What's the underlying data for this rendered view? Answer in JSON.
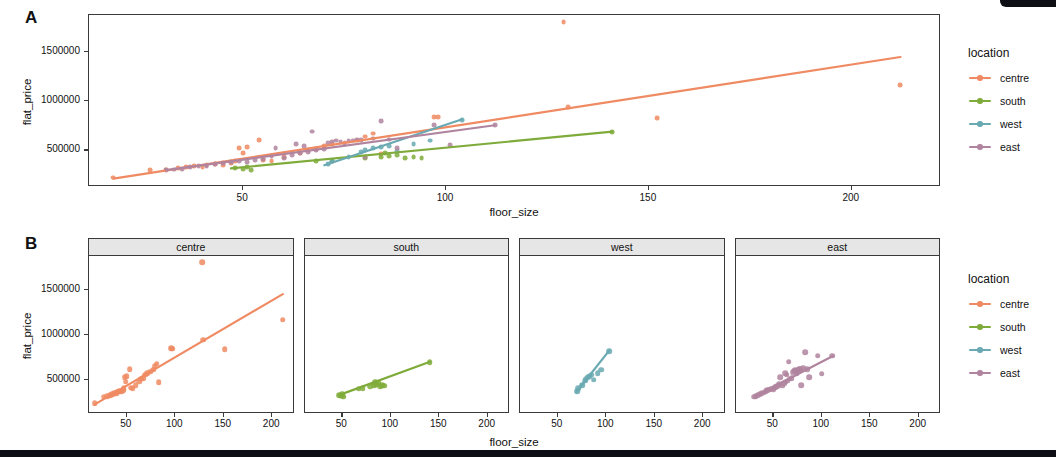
{
  "figure": {
    "panel_a_letter": "A",
    "panel_b_letter": "B"
  },
  "legend": {
    "title": "location",
    "entries": [
      {
        "label": "centre",
        "color": "#ef8a62"
      },
      {
        "label": "south",
        "color": "#7fab3a"
      },
      {
        "label": "west",
        "color": "#69a9b2"
      },
      {
        "label": "east",
        "color": "#b0849e"
      }
    ]
  },
  "axes": {
    "xlabel": "floor_size",
    "ylabel": "flat_price",
    "y_ticks": [
      "500000",
      "1000000",
      "1500000"
    ],
    "x_ticks_panel_a": [
      "50",
      "100",
      "150",
      "200"
    ],
    "x_ticks_panel_b": [
      "50",
      "100",
      "150",
      "200"
    ]
  },
  "facets": {
    "labels": [
      "centre",
      "south",
      "west",
      "east"
    ]
  },
  "chart_data": {
    "type": "scatter",
    "title": "",
    "xlabel": "floor_size",
    "ylabel": "flat_price",
    "xlim": [
      12,
      222
    ],
    "ylim": [
      130000,
      1870000
    ],
    "y_ticks": [
      500000,
      1000000,
      1500000
    ],
    "x_ticks": [
      50,
      100,
      150,
      200
    ],
    "grid": false,
    "legend_title": "location",
    "legend_position": "right",
    "panels": [
      {
        "letter": "A",
        "description": "All locations overlaid in a single panel with per-group linear fits"
      },
      {
        "letter": "B",
        "description": "Faceted by location, one panel per group with its own linear fit"
      }
    ],
    "series": [
      {
        "name": "centre",
        "color": "#ef8a62",
        "points": [
          [
            18,
            225000
          ],
          [
            27,
            300000
          ],
          [
            31,
            305000
          ],
          [
            34,
            320000
          ],
          [
            36,
            330000
          ],
          [
            38,
            340000
          ],
          [
            40,
            335000
          ],
          [
            41,
            355000
          ],
          [
            43,
            360000
          ],
          [
            45,
            355000
          ],
          [
            47,
            370000
          ],
          [
            48,
            395000
          ],
          [
            49,
            520000
          ],
          [
            50,
            470000
          ],
          [
            51,
            530000
          ],
          [
            54,
            605000
          ],
          [
            55,
            400000
          ],
          [
            57,
            395000
          ],
          [
            60,
            430000
          ],
          [
            64,
            470000
          ],
          [
            66,
            500000
          ],
          [
            68,
            510000
          ],
          [
            70,
            545000
          ],
          [
            72,
            560000
          ],
          [
            75,
            580000
          ],
          [
            78,
            600000
          ],
          [
            80,
            640000
          ],
          [
            82,
            670000
          ],
          [
            84,
            460000
          ],
          [
            97,
            840000
          ],
          [
            98,
            835000
          ],
          [
            129,
            1800000
          ],
          [
            130,
            935000
          ],
          [
            152,
            830000
          ],
          [
            212,
            1160000
          ]
        ],
        "fit": {
          "x0": 18,
          "y0": 215000,
          "x1": 212,
          "y1": 1445000
        }
      },
      {
        "name": "south",
        "color": "#7fab3a",
        "points": [
          [
            48,
            320000
          ],
          [
            50,
            310000
          ],
          [
            51,
            330000
          ],
          [
            52,
            300000
          ],
          [
            68,
            390000
          ],
          [
            72,
            395000
          ],
          [
            80,
            420000
          ],
          [
            84,
            430000
          ],
          [
            85,
            470000
          ],
          [
            86,
            440000
          ],
          [
            88,
            455000
          ],
          [
            90,
            420000
          ],
          [
            92,
            430000
          ],
          [
            94,
            425000
          ],
          [
            141,
            685000
          ]
        ],
        "fit": {
          "x0": 47,
          "y0": 318000,
          "x1": 141,
          "y1": 690000
        }
      },
      {
        "name": "west",
        "color": "#69a9b2",
        "points": [
          [
            71,
            360000
          ],
          [
            72,
            395000
          ],
          [
            76,
            430000
          ],
          [
            79,
            480000
          ],
          [
            80,
            500000
          ],
          [
            82,
            520000
          ],
          [
            84,
            530000
          ],
          [
            86,
            545000
          ],
          [
            88,
            490000
          ],
          [
            92,
            560000
          ],
          [
            96,
            600000
          ],
          [
            104,
            810000
          ]
        ],
        "fit": {
          "x0": 70,
          "y0": 350000,
          "x1": 104,
          "y1": 815000
        }
      },
      {
        "name": "east",
        "color": "#b0849e",
        "points": [
          [
            31,
            300000
          ],
          [
            33,
            305000
          ],
          [
            35,
            315000
          ],
          [
            37,
            330000
          ],
          [
            39,
            340000
          ],
          [
            41,
            345000
          ],
          [
            43,
            360000
          ],
          [
            45,
            370000
          ],
          [
            47,
            380000
          ],
          [
            49,
            390000
          ],
          [
            51,
            385000
          ],
          [
            53,
            405000
          ],
          [
            55,
            415000
          ],
          [
            57,
            440000
          ],
          [
            58,
            520000
          ],
          [
            60,
            425000
          ],
          [
            62,
            450000
          ],
          [
            63,
            560000
          ],
          [
            64,
            470000
          ],
          [
            65,
            545000
          ],
          [
            66,
            480000
          ],
          [
            67,
            690000
          ],
          [
            68,
            500000
          ],
          [
            70,
            510000
          ],
          [
            71,
            575000
          ],
          [
            72,
            590000
          ],
          [
            73,
            600000
          ],
          [
            74,
            585000
          ],
          [
            75,
            560000
          ],
          [
            76,
            595000
          ],
          [
            77,
            600000
          ],
          [
            78,
            610000
          ],
          [
            79,
            605000
          ],
          [
            80,
            430000
          ],
          [
            82,
            620000
          ],
          [
            84,
            795000
          ],
          [
            86,
            610000
          ],
          [
            88,
            520000
          ],
          [
            97,
            760000
          ],
          [
            101,
            555000
          ],
          [
            112,
            760000
          ]
        ],
        "fit": {
          "x0": 31,
          "y0": 300000,
          "x1": 112,
          "y1": 755000
        }
      }
    ]
  }
}
